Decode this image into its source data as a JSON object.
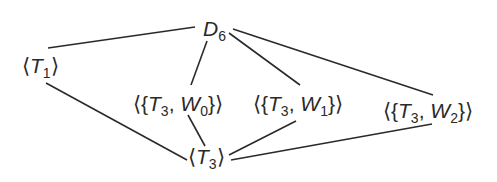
{
  "diagram": {
    "type": "subgroup-lattice",
    "nodes": [
      {
        "id": "D6",
        "base": "D",
        "sub": "6",
        "prefix": "",
        "suffix": "",
        "x": 203,
        "y": 18
      },
      {
        "id": "T1",
        "prefix": "⟨",
        "base": "T",
        "sub": "1",
        "suffix": "⟩",
        "x": 22,
        "y": 55
      },
      {
        "id": "T3W0",
        "prefix": "⟨{",
        "base": "T",
        "sub": "3",
        "mid": ", ",
        "base2": "W",
        "sub2": "0",
        "suffix": "}⟩",
        "x": 133,
        "y": 93
      },
      {
        "id": "T3W1",
        "prefix": "⟨{",
        "base": "T",
        "sub": "3",
        "mid": ", ",
        "base2": "W",
        "sub2": "1",
        "suffix": "}⟩",
        "x": 253,
        "y": 93
      },
      {
        "id": "T3W2",
        "prefix": "⟨{",
        "base": "T",
        "sub": "3",
        "mid": ", ",
        "base2": "W",
        "sub2": "2",
        "suffix": "}⟩",
        "x": 383,
        "y": 100
      },
      {
        "id": "T3",
        "prefix": "⟨",
        "base": "T",
        "sub": "3",
        "suffix": "⟩",
        "x": 188,
        "y": 146
      }
    ],
    "edges": [
      {
        "from": "D6",
        "to": "T1",
        "x1": 195,
        "y1": 27,
        "x2": 48,
        "y2": 48
      },
      {
        "from": "D6",
        "to": "T3W0",
        "x1": 207,
        "y1": 41,
        "x2": 191,
        "y2": 85
      },
      {
        "from": "D6",
        "to": "T3W1",
        "x1": 229,
        "y1": 33,
        "x2": 300,
        "y2": 85
      },
      {
        "from": "D6",
        "to": "T3W2",
        "x1": 233,
        "y1": 29,
        "x2": 433,
        "y2": 95
      },
      {
        "from": "T1",
        "to": "T3",
        "x1": 46,
        "y1": 83,
        "x2": 187,
        "y2": 160
      },
      {
        "from": "T3W0",
        "to": "T3",
        "x1": 188,
        "y1": 115,
        "x2": 205,
        "y2": 146
      },
      {
        "from": "T3W1",
        "to": "T3",
        "x1": 296,
        "y1": 121,
        "x2": 229,
        "y2": 155
      },
      {
        "from": "T3W2",
        "to": "T3",
        "x1": 432,
        "y1": 124,
        "x2": 231,
        "y2": 160
      }
    ],
    "colors": {
      "line": "#2a2a2a",
      "text": "#2a2a2a",
      "background": "#ffffff"
    }
  }
}
